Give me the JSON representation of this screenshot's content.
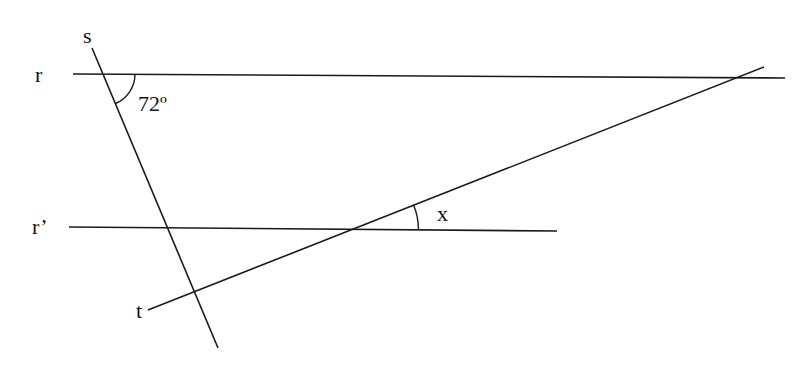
{
  "diagram": {
    "stroke_color": "#1a1a1a",
    "labels": {
      "line_r": "r",
      "line_r_prime": "r’",
      "line_s": "s",
      "line_t": "t",
      "angle_given": "72º",
      "angle_unknown": "x"
    },
    "lines": [
      {
        "name": "r",
        "x1": 73,
        "y1": 74,
        "x2": 785,
        "y2": 78
      },
      {
        "name": "r_prime",
        "x1": 69,
        "y1": 227,
        "x2": 557,
        "y2": 231
      },
      {
        "name": "s",
        "x1": 92,
        "y1": 48,
        "x2": 218,
        "y2": 348
      },
      {
        "name": "t",
        "x1": 148,
        "y1": 310,
        "x2": 764,
        "y2": 67
      }
    ],
    "angles": [
      {
        "name": "72-degree-angle",
        "vertex": [
          103,
          74
        ],
        "value": "72º"
      },
      {
        "name": "x-angle",
        "vertex": [
          352,
          229
        ],
        "value": "x"
      }
    ]
  }
}
